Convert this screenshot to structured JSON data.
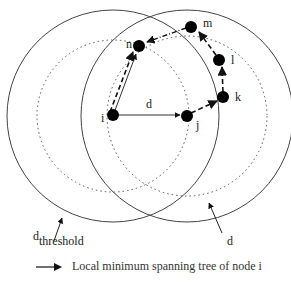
{
  "diagram": {
    "nodes": [
      {
        "id": "i",
        "label": "i",
        "x": 113,
        "y": 115
      },
      {
        "id": "j",
        "label": "j",
        "x": 187,
        "y": 116
      },
      {
        "id": "k",
        "label": "k",
        "x": 223,
        "y": 97
      },
      {
        "id": "l",
        "label": "l",
        "x": 219,
        "y": 60
      },
      {
        "id": "m",
        "label": "m",
        "x": 191,
        "y": 27
      },
      {
        "id": "n",
        "label": "n",
        "x": 139,
        "y": 46
      }
    ],
    "edge_label_d": "d",
    "threshold_label_main": "d",
    "threshold_label_sub": "threshold",
    "range_label": "d",
    "colors": {
      "stroke": "#222222",
      "node": "#000000",
      "circle": "#444444"
    }
  },
  "legend": {
    "text": "Local minimum spanning tree of node i",
    "icon": "arrow-right-icon"
  }
}
